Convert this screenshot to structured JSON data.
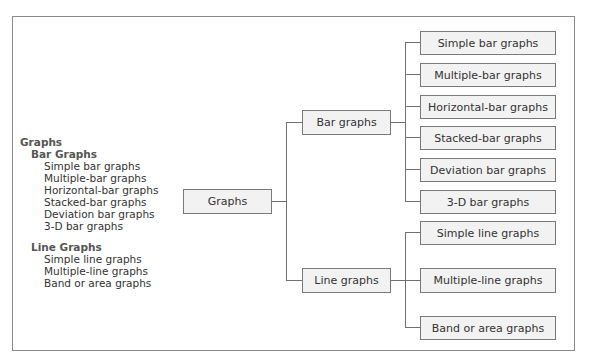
{
  "outline": {
    "root": "Graphs",
    "groups": [
      {
        "title": "Bar Graphs",
        "items": [
          "Simple bar graphs",
          "Multiple-bar graphs",
          "Horizontal-bar graphs",
          "Stacked-bar graphs",
          "Deviation bar graphs",
          "3-D bar graphs"
        ]
      },
      {
        "title": "Line Graphs",
        "items": [
          "Simple line graphs",
          "Multiple-line graphs",
          "Band or area graphs"
        ]
      }
    ]
  },
  "tree": {
    "root": "Graphs",
    "branches": [
      {
        "label": "Bar graphs",
        "leaves": [
          "Simple bar graphs",
          "Multiple-bar graphs",
          "Horizontal-bar graphs",
          "Stacked-bar graphs",
          "Deviation bar graphs",
          "3-D bar graphs"
        ]
      },
      {
        "label": "Line graphs",
        "leaves": [
          "Simple line graphs",
          "Multiple-line graphs",
          "Band or area graphs"
        ]
      }
    ]
  },
  "colors": {
    "box_fill": "#f2f2f2",
    "box_border": "#7a7a7a",
    "connector": "#707070",
    "frame": "#8a8a8a"
  }
}
